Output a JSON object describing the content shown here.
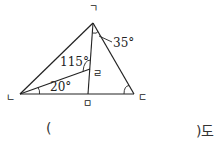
{
  "figure": {
    "vertices": {
      "A": {
        "label": "ㄱ",
        "x": 93,
        "y": 23
      },
      "B": {
        "label": "ㄴ",
        "x": 20,
        "y": 94
      },
      "C": {
        "label": "ㄷ",
        "x": 134,
        "y": 94
      },
      "M": {
        "label": "ㅁ",
        "x": 88,
        "y": 94
      },
      "R": {
        "label": "ㄹ",
        "x": 90,
        "y": 69
      }
    },
    "angles": {
      "angle_at_A": "35°",
      "angle_at_R": "115°",
      "angle_at_B": "20°"
    }
  },
  "answer": {
    "open_paren": "(",
    "close_paren_unit": ")도"
  }
}
